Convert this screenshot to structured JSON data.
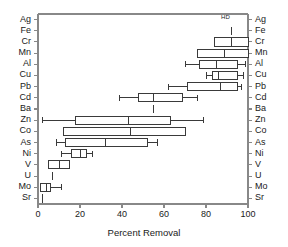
{
  "chart_data": {
    "type": "box",
    "orientation": "horizontal",
    "title": "",
    "xlabel": "Percent Removal",
    "ylabel": "",
    "xlim": [
      0,
      100
    ],
    "xticks": [
      0,
      20,
      40,
      60,
      80,
      100
    ],
    "xtick_labels": [
      "0",
      "20",
      "40",
      "60",
      "80",
      "100"
    ],
    "grid": false,
    "legend": false,
    "annotations": [
      {
        "text": "HD",
        "x": 89,
        "category": "Ag"
      }
    ],
    "categories": [
      "Ag",
      "Fe",
      "Cr",
      "Mn",
      "Al",
      "Cu",
      "Pb",
      "Cd",
      "Ba",
      "Zn",
      "Co",
      "As",
      "Ni",
      "V",
      "U",
      "Mo",
      "Sr"
    ],
    "boxes": [
      {
        "category": "Ag",
        "whisker_low": null,
        "q1": null,
        "median": null,
        "q3": null,
        "whisker_high": null,
        "single_value": null
      },
      {
        "category": "Fe",
        "whisker_low": null,
        "q1": null,
        "median": 92,
        "q3": null,
        "whisker_high": null,
        "single_value": 92
      },
      {
        "category": "Cr",
        "whisker_low": 84,
        "q1": 84,
        "median": 92,
        "q3": 100,
        "whisker_high": 100,
        "single_value": null
      },
      {
        "category": "Mn",
        "whisker_low": 76,
        "q1": 76,
        "median": 89,
        "q3": 100,
        "whisker_high": 100,
        "single_value": null
      },
      {
        "category": "Al",
        "whisker_low": 70,
        "q1": 77,
        "median": 85,
        "q3": 95,
        "whisker_high": 99,
        "single_value": null
      },
      {
        "category": "Cu",
        "whisker_low": 80,
        "q1": 83,
        "median": 86,
        "q3": 95,
        "whisker_high": 98,
        "single_value": null
      },
      {
        "category": "Pb",
        "whisker_low": 62,
        "q1": 71,
        "median": 87,
        "q3": 95,
        "whisker_high": 97,
        "single_value": null
      },
      {
        "category": "Cd",
        "whisker_low": 39,
        "q1": 48,
        "median": 55,
        "q3": 69,
        "whisker_high": 76,
        "single_value": null
      },
      {
        "category": "Ba",
        "whisker_low": null,
        "q1": null,
        "median": 55,
        "q3": null,
        "whisker_high": null,
        "single_value": 55
      },
      {
        "category": "Zn",
        "whisker_low": 2,
        "q1": 18,
        "median": 43,
        "q3": 63,
        "whisker_high": 79,
        "single_value": null
      },
      {
        "category": "Co",
        "whisker_low": 12,
        "q1": 12,
        "median": 44,
        "q3": 70,
        "whisker_high": 70,
        "single_value": null
      },
      {
        "category": "As",
        "whisker_low": 9,
        "q1": 13,
        "median": 32,
        "q3": 52,
        "whisker_high": 57,
        "single_value": null
      },
      {
        "category": "Ni",
        "whisker_low": 11,
        "q1": 16,
        "median": 20,
        "q3": 23,
        "whisker_high": 26,
        "single_value": null
      },
      {
        "category": "V",
        "whisker_low": 5,
        "q1": 5,
        "median": 10,
        "q3": 15,
        "whisker_high": 15,
        "single_value": null
      },
      {
        "category": "U",
        "whisker_low": null,
        "q1": null,
        "median": 7,
        "q3": null,
        "whisker_high": null,
        "single_value": 7
      },
      {
        "category": "Mo",
        "whisker_low": 1,
        "q1": 1,
        "median": 4,
        "q3": 6,
        "whisker_high": 11,
        "single_value": null
      },
      {
        "category": "Sr",
        "whisker_low": null,
        "q1": null,
        "median": 2,
        "q3": null,
        "whisker_high": null,
        "single_value": 2
      }
    ],
    "colors": {
      "axis": "#888888",
      "box_stroke": "#3a3a3a",
      "box_fill": "#ffffff",
      "text": "#1a1a1a"
    }
  }
}
